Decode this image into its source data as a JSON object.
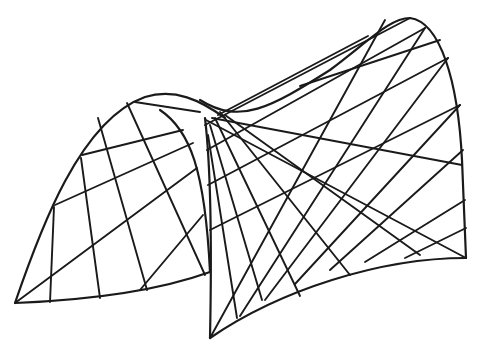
{
  "figure": {
    "stroke_color": "#1a1a1a",
    "background": "#ffffff"
  },
  "edges": [
    {
      "name": "left-arch-outer",
      "d": "M15,303 C40,230 80,120 145,97 C175,88 200,100 225,118"
    },
    {
      "name": "left-arch-bottom",
      "d": "M15,303 C90,300 160,290 210,272"
    },
    {
      "name": "left-arch-inner",
      "d": "M160,110 C190,130 205,170 210,272"
    },
    {
      "name": "saddle-ridge",
      "d": "M200,100 C240,125 270,108 330,70 C370,40 390,18 410,18 C440,22 458,80 462,160 L466,258"
    },
    {
      "name": "front-spine",
      "d": "M205,118 C210,160 212,240 210,338"
    },
    {
      "name": "front-bottom",
      "d": "M210,338 C280,290 380,258 466,258"
    }
  ],
  "rulings": [
    {
      "x1": 82,
      "y1": 155,
      "x2": 183,
      "y2": 130
    },
    {
      "x1": 55,
      "y1": 205,
      "x2": 193,
      "y2": 143
    },
    {
      "x1": 15,
      "y1": 303,
      "x2": 197,
      "y2": 168
    },
    {
      "x1": 140,
      "y1": 290,
      "x2": 203,
      "y2": 215
    },
    {
      "x1": 127,
      "y1": 103,
      "x2": 205,
      "y2": 275
    },
    {
      "x1": 98,
      "y1": 118,
      "x2": 147,
      "y2": 290
    },
    {
      "x1": 81,
      "y1": 158,
      "x2": 100,
      "y2": 298
    },
    {
      "x1": 54,
      "y1": 207,
      "x2": 50,
      "y2": 302
    },
    {
      "x1": 135,
      "y1": 102,
      "x2": 200,
      "y2": 112
    },
    {
      "x1": 206,
      "y1": 120,
      "x2": 466,
      "y2": 258
    },
    {
      "x1": 205,
      "y1": 125,
      "x2": 410,
      "y2": 18
    },
    {
      "x1": 207,
      "y1": 150,
      "x2": 425,
      "y2": 28
    },
    {
      "x1": 208,
      "y1": 185,
      "x2": 448,
      "y2": 58
    },
    {
      "x1": 210,
      "y1": 230,
      "x2": 460,
      "y2": 105
    },
    {
      "x1": 210,
      "y1": 338,
      "x2": 385,
      "y2": 20
    },
    {
      "x1": 240,
      "y1": 316,
      "x2": 425,
      "y2": 28
    },
    {
      "x1": 265,
      "y1": 300,
      "x2": 448,
      "y2": 58
    },
    {
      "x1": 295,
      "y1": 284,
      "x2": 460,
      "y2": 105
    },
    {
      "x1": 330,
      "y1": 270,
      "x2": 463,
      "y2": 150
    },
    {
      "x1": 365,
      "y1": 262,
      "x2": 465,
      "y2": 200
    },
    {
      "x1": 405,
      "y1": 258,
      "x2": 466,
      "y2": 228
    },
    {
      "x1": 212,
      "y1": 118,
      "x2": 462,
      "y2": 165
    },
    {
      "x1": 218,
      "y1": 115,
      "x2": 368,
      "y2": 36
    },
    {
      "x1": 215,
      "y1": 118,
      "x2": 300,
      "y2": 296
    },
    {
      "x1": 210,
      "y1": 125,
      "x2": 262,
      "y2": 300
    },
    {
      "x1": 208,
      "y1": 135,
      "x2": 237,
      "y2": 318
    },
    {
      "x1": 220,
      "y1": 112,
      "x2": 350,
      "y2": 275
    },
    {
      "x1": 225,
      "y1": 115,
      "x2": 420,
      "y2": 255
    },
    {
      "x1": 300,
      "y1": 86,
      "x2": 440,
      "y2": 40
    }
  ]
}
